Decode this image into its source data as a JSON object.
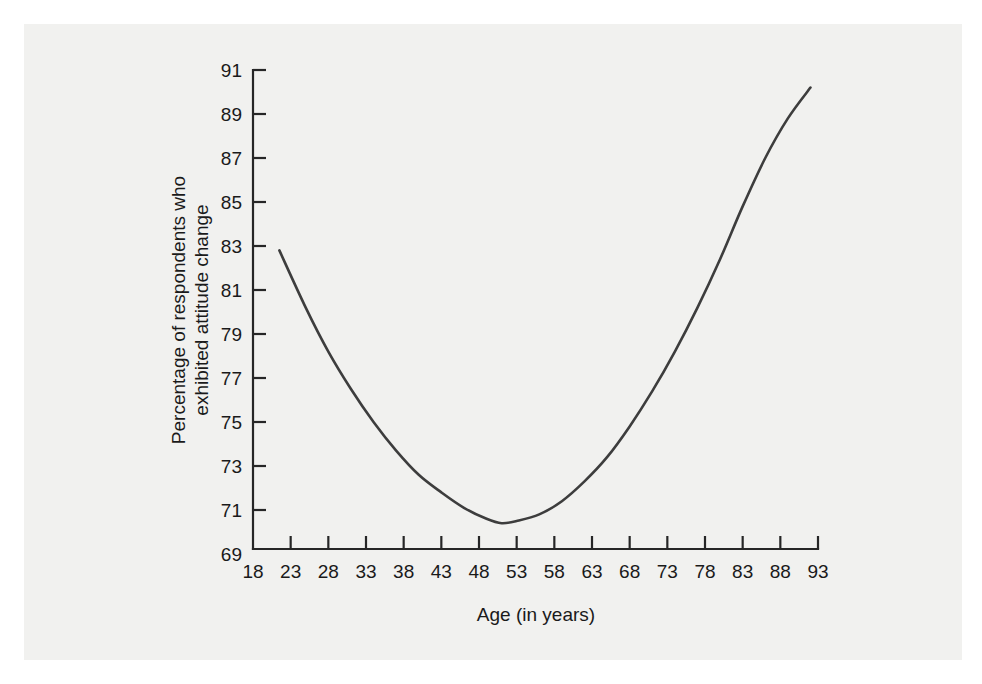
{
  "figure": {
    "background_color": "#ffffff",
    "panel_color": "#f1f1ef",
    "ink_color": "#262626",
    "curve_color": "#3d3d3d"
  },
  "chart_data": {
    "type": "line",
    "title": "",
    "subtitle": "",
    "xlabel": "Age (in years)",
    "ylabel": "Percentage of respondents who exhibited attitude change",
    "ylabel_line1": "Percentage of respondents who",
    "ylabel_line2": "exhibited attitude change",
    "xlim": [
      18,
      93
    ],
    "ylim": [
      69,
      91
    ],
    "grid": false,
    "legend": false,
    "legend_position": "none",
    "xticks": [
      18,
      23,
      28,
      33,
      38,
      43,
      48,
      53,
      58,
      63,
      68,
      73,
      78,
      83,
      88,
      93
    ],
    "yticks": [
      69,
      71,
      73,
      75,
      77,
      79,
      81,
      83,
      85,
      87,
      89,
      91
    ],
    "xtick_labels": [
      "18",
      "23",
      "28",
      "33",
      "38",
      "43",
      "48",
      "53",
      "58",
      "63",
      "68",
      "73",
      "78",
      "83",
      "88",
      "93"
    ],
    "ytick_labels": [
      "69",
      "71",
      "73",
      "75",
      "77",
      "79",
      "81",
      "83",
      "85",
      "87",
      "89",
      "91"
    ],
    "series": [
      {
        "name": "Attitude change by age",
        "x": [
          21.5,
          25,
          28,
          31,
          34,
          37,
          40,
          43,
          46,
          49,
          51,
          53,
          56,
          59,
          62,
          65,
          68,
          71,
          74,
          77,
          80,
          83,
          86,
          89,
          92
        ],
        "y": [
          82.8,
          80.2,
          78.2,
          76.5,
          75.0,
          73.7,
          72.6,
          71.8,
          71.1,
          70.6,
          70.4,
          70.5,
          70.8,
          71.4,
          72.3,
          73.4,
          74.8,
          76.4,
          78.2,
          80.2,
          82.4,
          84.8,
          87.0,
          88.8,
          90.2
        ]
      }
    ],
    "annotations": []
  }
}
